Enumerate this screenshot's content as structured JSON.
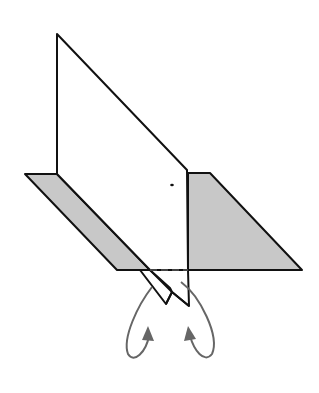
{
  "diagram": {
    "type": "origami-step",
    "colors": {
      "background": "#ffffff",
      "paper_front": "#ffffff",
      "paper_back": "#c8c8c8",
      "outline": "#111111",
      "arrow": "#666666",
      "dashed_line": "#555555"
    },
    "elements": {
      "vertical_panel": "white-paper-panel",
      "left_flap": "gray-base-left",
      "right_flap": "gray-base-right",
      "bottom_flaps": "tuck-flaps",
      "hidden_edge": "dashed-fold-line",
      "arrows": [
        "left-curved-arrow",
        "right-curved-arrow"
      ],
      "reference_dot": "small-dot-mark"
    }
  }
}
